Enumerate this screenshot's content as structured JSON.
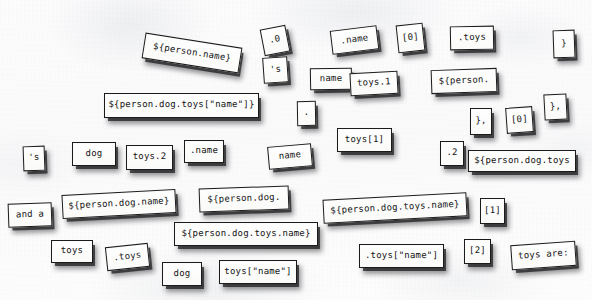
{
  "scene": {
    "title": "Refrigerator magnet word tiles",
    "surface_color": "#fcfcfd",
    "tile_fill": "#fbfbfa",
    "tile_border": "#1b1b1b",
    "text_color": "#141414",
    "shadow_color": "rgba(25,25,28,0.72)"
  },
  "tiles": [
    {
      "id": "t01",
      "text": "${person.name}",
      "x": 143,
      "y": 40,
      "w": 98,
      "h": 26,
      "rot": 9,
      "fs": 9
    },
    {
      "id": "t02",
      "text": ".0",
      "x": 262,
      "y": 27,
      "w": 26,
      "h": 27,
      "rot": -11,
      "fs": 9
    },
    {
      "id": "t03",
      "text": "'s",
      "x": 263,
      "y": 57,
      "w": 25,
      "h": 26,
      "rot": -4,
      "fs": 9
    },
    {
      "id": "t04",
      "text": ".name",
      "x": 331,
      "y": 28,
      "w": 47,
      "h": 24,
      "rot": -7,
      "fs": 9
    },
    {
      "id": "t05",
      "text": "[0]",
      "x": 397,
      "y": 24,
      "w": 27,
      "h": 28,
      "rot": -6,
      "fs": 9
    },
    {
      "id": "t06",
      "text": ".toys",
      "x": 450,
      "y": 26,
      "w": 44,
      "h": 24,
      "rot": -1,
      "fs": 9
    },
    {
      "id": "t07",
      "text": "}",
      "x": 553,
      "y": 30,
      "w": 22,
      "h": 28,
      "rot": -2,
      "fs": 9
    },
    {
      "id": "t08",
      "text": "name",
      "x": 310,
      "y": 68,
      "w": 42,
      "h": 22,
      "rot": -1,
      "fs": 9
    },
    {
      "id": "t09",
      "text": "toys.1",
      "x": 350,
      "y": 72,
      "w": 48,
      "h": 23,
      "rot": -3,
      "fs": 9
    },
    {
      "id": "t10",
      "text": "${person.",
      "x": 431,
      "y": 69,
      "w": 66,
      "h": 24,
      "rot": -2,
      "fs": 9
    },
    {
      "id": "t11",
      "text": "${person.dog.toys[\"name\"]}",
      "x": 104,
      "y": 93,
      "w": 155,
      "h": 25,
      "rot": 0,
      "fs": 9
    },
    {
      "id": "t12",
      "text": ".",
      "x": 297,
      "y": 101,
      "w": 19,
      "h": 25,
      "rot": -1,
      "fs": 9
    },
    {
      "id": "t13",
      "text": "},",
      "x": 470,
      "y": 108,
      "w": 22,
      "h": 27,
      "rot": 0,
      "fs": 9
    },
    {
      "id": "t14",
      "text": "[0]",
      "x": 506,
      "y": 107,
      "w": 27,
      "h": 26,
      "rot": -4,
      "fs": 9
    },
    {
      "id": "t15",
      "text": "},",
      "x": 544,
      "y": 94,
      "w": 23,
      "h": 26,
      "rot": -3,
      "fs": 9
    },
    {
      "id": "t16",
      "text": "toys[1]",
      "x": 337,
      "y": 128,
      "w": 55,
      "h": 24,
      "rot": 0,
      "fs": 9
    },
    {
      "id": "t17",
      "text": "'s",
      "x": 23,
      "y": 146,
      "w": 22,
      "h": 25,
      "rot": -2,
      "fs": 9
    },
    {
      "id": "t18",
      "text": "dog",
      "x": 72,
      "y": 142,
      "w": 44,
      "h": 24,
      "rot": 0,
      "fs": 9
    },
    {
      "id": "t19",
      "text": "toys.2",
      "x": 126,
      "y": 145,
      "w": 47,
      "h": 25,
      "rot": 0,
      "fs": 9
    },
    {
      "id": "t20",
      "text": ".name",
      "x": 184,
      "y": 140,
      "w": 40,
      "h": 23,
      "rot": 0,
      "fs": 9
    },
    {
      "id": "t21",
      "text": "name",
      "x": 268,
      "y": 145,
      "w": 44,
      "h": 23,
      "rot": -5,
      "fs": 9
    },
    {
      "id": "t22",
      "text": ".2",
      "x": 440,
      "y": 141,
      "w": 24,
      "h": 25,
      "rot": 0,
      "fs": 9
    },
    {
      "id": "t23",
      "text": "${person.dog.toys",
      "x": 468,
      "y": 150,
      "w": 108,
      "h": 22,
      "rot": 0,
      "fs": 9
    },
    {
      "id": "t24",
      "text": "${person.dog.name}",
      "x": 62,
      "y": 192,
      "w": 114,
      "h": 24,
      "rot": -3,
      "fs": 9
    },
    {
      "id": "t25",
      "text": "${person.dog.",
      "x": 199,
      "y": 187,
      "w": 90,
      "h": 24,
      "rot": -2,
      "fs": 9
    },
    {
      "id": "t26",
      "text": "and a",
      "x": 8,
      "y": 203,
      "w": 44,
      "h": 24,
      "rot": -2,
      "fs": 9
    },
    {
      "id": "t27",
      "text": "${person.dog.toys.name}",
      "x": 174,
      "y": 222,
      "w": 144,
      "h": 24,
      "rot": 0,
      "fs": 9
    },
    {
      "id": "t28",
      "text": "${person.dog.toys.name}",
      "x": 323,
      "y": 196,
      "w": 144,
      "h": 24,
      "rot": -3,
      "fs": 9
    },
    {
      "id": "t29",
      "text": "[1]",
      "x": 480,
      "y": 198,
      "w": 25,
      "h": 26,
      "rot": 0,
      "fs": 9
    },
    {
      "id": "t30",
      "text": "toys",
      "x": 51,
      "y": 240,
      "w": 42,
      "h": 23,
      "rot": 0,
      "fs": 9
    },
    {
      "id": "t31",
      "text": ".toys",
      "x": 106,
      "y": 245,
      "w": 43,
      "h": 24,
      "rot": -6,
      "fs": 9
    },
    {
      "id": "t32",
      "text": "dog",
      "x": 162,
      "y": 262,
      "w": 40,
      "h": 24,
      "rot": 0,
      "fs": 9
    },
    {
      "id": "t33",
      "text": "toys[\"name\"]",
      "x": 219,
      "y": 260,
      "w": 78,
      "h": 24,
      "rot": 0,
      "fs": 9
    },
    {
      "id": "t34",
      "text": ".toys[\"name\"]",
      "x": 359,
      "y": 244,
      "w": 85,
      "h": 24,
      "rot": 0,
      "fs": 9
    },
    {
      "id": "t35",
      "text": "[2]",
      "x": 464,
      "y": 239,
      "w": 27,
      "h": 25,
      "rot": 0,
      "fs": 9
    },
    {
      "id": "t36",
      "text": "toys are:",
      "x": 511,
      "y": 243,
      "w": 65,
      "h": 25,
      "rot": -4,
      "fs": 9
    }
  ]
}
